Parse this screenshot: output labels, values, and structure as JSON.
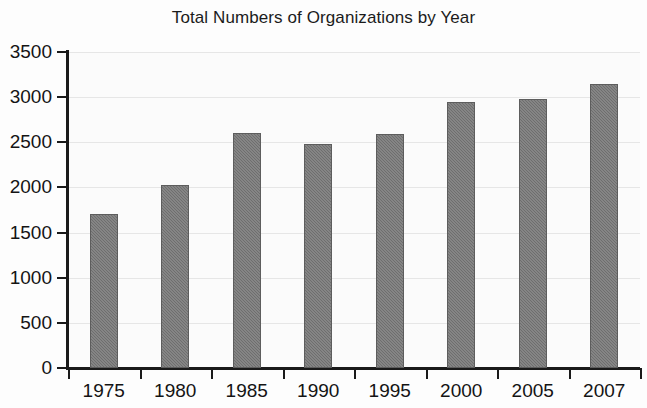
{
  "chart_data": {
    "type": "bar",
    "title": "Total Numbers of Organizations by Year",
    "xlabel": "",
    "ylabel": "",
    "categories": [
      "1975",
      "1980",
      "1985",
      "1990",
      "1995",
      "2000",
      "2005",
      "2007"
    ],
    "values": [
      1710,
      2030,
      2600,
      2480,
      2590,
      2950,
      2980,
      3150
    ],
    "ylim": [
      0,
      3500
    ],
    "yticks": [
      0,
      500,
      1000,
      1500,
      2000,
      2500,
      3000,
      3500
    ],
    "ytick_labels": [
      "0",
      "500",
      "1000",
      "1500",
      "2000",
      "2500",
      "3000",
      "3500"
    ],
    "grid": true,
    "legend": false,
    "series": [
      {
        "name": "Total Numbers of Organizations",
        "values": [
          1710,
          2030,
          2600,
          2480,
          2590,
          2950,
          2980,
          3150
        ]
      }
    ],
    "colors": {
      "bar_fill": "#6e6e6e",
      "bar_edge": "#5d5d5d",
      "axis": "#1a1a1a",
      "gridline": "#e6e6e6",
      "background": "#fbfbfb",
      "text": "#141414"
    }
  }
}
